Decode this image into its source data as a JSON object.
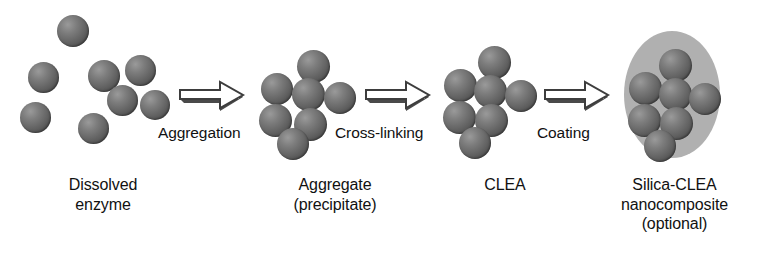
{
  "diagram": {
    "title": "CLEA preparation scheme",
    "background_color": "#ffffff",
    "sphere_color": "#636363",
    "silica_color": "#b0b0b0",
    "link_color": "#4a4a4a",
    "text_color": "#111111"
  },
  "stages": [
    {
      "id": "dissolved-enzyme",
      "label": "Dissolved\nenzyme",
      "label_x": 28,
      "label_y": 175,
      "label_w": 150,
      "spheres": [
        {
          "x": 57,
          "y": 15,
          "d": 32
        },
        {
          "x": 125,
          "y": 55,
          "d": 31
        },
        {
          "x": 28,
          "y": 62,
          "d": 31
        },
        {
          "x": 88,
          "y": 60,
          "d": 32
        },
        {
          "x": 140,
          "y": 90,
          "d": 30
        },
        {
          "x": 20,
          "y": 102,
          "d": 31
        },
        {
          "x": 78,
          "y": 113,
          "d": 31
        },
        {
          "x": 107,
          "y": 85,
          "d": 31
        }
      ],
      "links": []
    },
    {
      "id": "aggregate",
      "label": "Aggregate\n(precipitate)",
      "label_x": 255,
      "label_y": 175,
      "label_w": 160,
      "spheres": [
        {
          "x": 297,
          "y": 50,
          "d": 33
        },
        {
          "x": 261,
          "y": 73,
          "d": 32
        },
        {
          "x": 292,
          "y": 78,
          "d": 33
        },
        {
          "x": 324,
          "y": 82,
          "d": 32
        },
        {
          "x": 259,
          "y": 104,
          "d": 33
        },
        {
          "x": 294,
          "y": 108,
          "d": 33
        },
        {
          "x": 277,
          "y": 128,
          "d": 32
        }
      ],
      "links": []
    },
    {
      "id": "clea",
      "label": "CLEA",
      "label_x": 440,
      "label_y": 175,
      "label_w": 130,
      "spheres": [
        {
          "x": 478,
          "y": 46,
          "d": 33
        },
        {
          "x": 444,
          "y": 69,
          "d": 33
        },
        {
          "x": 474,
          "y": 75,
          "d": 33
        },
        {
          "x": 505,
          "y": 80,
          "d": 32
        },
        {
          "x": 443,
          "y": 101,
          "d": 33
        },
        {
          "x": 475,
          "y": 104,
          "d": 33
        },
        {
          "x": 459,
          "y": 127,
          "d": 32
        }
      ],
      "links": [
        {
          "x1": 494,
          "y1": 62,
          "x2": 491,
          "y2": 91
        },
        {
          "x1": 461,
          "y1": 85,
          "x2": 491,
          "y2": 91
        },
        {
          "x1": 491,
          "y1": 91,
          "x2": 521,
          "y2": 96
        },
        {
          "x1": 460,
          "y1": 85,
          "x2": 459,
          "y2": 117
        },
        {
          "x1": 459,
          "y1": 117,
          "x2": 491,
          "y2": 120
        },
        {
          "x1": 491,
          "y1": 120,
          "x2": 475,
          "y2": 143
        }
      ]
    },
    {
      "id": "silica-clea",
      "label": "Silica-CLEA\nnanocomposite\n(optional)",
      "label_x": 592,
      "label_y": 175,
      "label_w": 165,
      "shell": {
        "x": 624,
        "y": 31,
        "w": 96,
        "h": 127
      },
      "spheres": [
        {
          "x": 659,
          "y": 49,
          "d": 33
        },
        {
          "x": 629,
          "y": 72,
          "d": 33
        },
        {
          "x": 659,
          "y": 78,
          "d": 33
        },
        {
          "x": 689,
          "y": 83,
          "d": 32
        },
        {
          "x": 628,
          "y": 104,
          "d": 33
        },
        {
          "x": 660,
          "y": 107,
          "d": 33
        },
        {
          "x": 644,
          "y": 130,
          "d": 32
        }
      ],
      "links": [
        {
          "x1": 675,
          "y1": 65,
          "x2": 675,
          "y2": 94
        },
        {
          "x1": 645,
          "y1": 88,
          "x2": 675,
          "y2": 94
        },
        {
          "x1": 675,
          "y1": 94,
          "x2": 705,
          "y2": 99
        },
        {
          "x1": 645,
          "y1": 88,
          "x2": 644,
          "y2": 120
        },
        {
          "x1": 644,
          "y1": 120,
          "x2": 676,
          "y2": 123
        },
        {
          "x1": 676,
          "y1": 123,
          "x2": 660,
          "y2": 146
        }
      ]
    }
  ],
  "arrows": [
    {
      "id": "aggregation-arrow",
      "label": "Aggregation",
      "x": 176,
      "y": 78,
      "w": 72,
      "h": 38,
      "label_x": 158,
      "label_y": 124
    },
    {
      "id": "crosslinking-arrow",
      "label": "Cross-linking",
      "x": 362,
      "y": 78,
      "w": 72,
      "h": 38,
      "label_x": 335,
      "label_y": 124
    },
    {
      "id": "coating-arrow",
      "label": "Coating",
      "x": 541,
      "y": 78,
      "w": 72,
      "h": 38,
      "label_x": 537,
      "label_y": 124
    }
  ]
}
